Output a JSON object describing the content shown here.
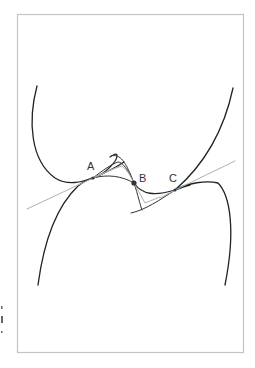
{
  "figure": {
    "type": "tangent-curves-diagram",
    "colors": {
      "curve": "#222222",
      "tangent": "#b0b0b0",
      "frame": "#c4c4c4",
      "background": "#ffffff"
    },
    "points": [
      {
        "id": "A",
        "label": "A",
        "x": 93,
        "y": 178
      },
      {
        "id": "B",
        "label": "B",
        "x": 134,
        "y": 183
      },
      {
        "id": "C",
        "label": "C",
        "x": 175,
        "y": 190
      }
    ],
    "elements": {
      "frame": "figure-border",
      "curves": [
        "left-upper-curve",
        "left-lower-curve",
        "right-upper-curve",
        "right-lower-curve",
        "middle-curves"
      ],
      "tangent_lines": [
        "tangent-A",
        "tangent-C",
        "tangent-B"
      ]
    }
  }
}
